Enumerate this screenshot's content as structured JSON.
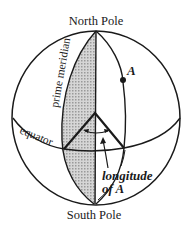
{
  "diagram": {
    "labels": {
      "north_pole": "North Pole",
      "south_pole": "South Pole",
      "prime_meridian": "prime meridian",
      "equator": "equator",
      "point": "A",
      "longitude_line1": "longitude",
      "longitude_line2": "of A"
    },
    "colors": {
      "ink": "#1a1a1a",
      "shading": "#c8c8c8",
      "background": "#ffffff"
    },
    "elements": [
      "sphere-outline",
      "prime-meridian-arc",
      "central-meridian-line",
      "meridian-through-A",
      "equator-arc",
      "angle-lines-from-center",
      "angle-arc-arrow",
      "pointer-arrow-to-angle",
      "point-A-dot"
    ]
  }
}
